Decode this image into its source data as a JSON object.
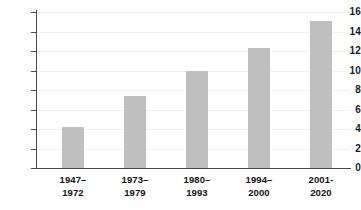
{
  "chart_data": {
    "type": "bar",
    "title": "",
    "subtitle": "",
    "xlabel": "",
    "ylabel": "",
    "categories": [
      "1947–\n1972",
      "1973–\n1979",
      "1980–\n1993",
      "1994–\n2000",
      "2001-\n2020"
    ],
    "category_lines": [
      [
        "1947–",
        "1972"
      ],
      [
        "1973–",
        "1979"
      ],
      [
        "1980–",
        "1993"
      ],
      [
        "1994–",
        "2000"
      ],
      [
        "2001-",
        "2020"
      ]
    ],
    "values": [
      4.2,
      7.4,
      10.0,
      12.3,
      15.1
    ],
    "ylim": [
      0,
      16
    ],
    "ytick_values": [
      0,
      2,
      4,
      6,
      8,
      10,
      12,
      14,
      16
    ],
    "ytick_labels": [
      "0",
      "2",
      "4",
      "6",
      "8",
      "10",
      "12",
      "14",
      "16"
    ],
    "grid": true,
    "legend": false,
    "legend_position": "none",
    "bar_color": "#bfbfbf",
    "axis_color": "#4a4a4a",
    "gridline_color": "#f1f1f1",
    "background_color": "#ffffff",
    "text_color": "#111111"
  }
}
